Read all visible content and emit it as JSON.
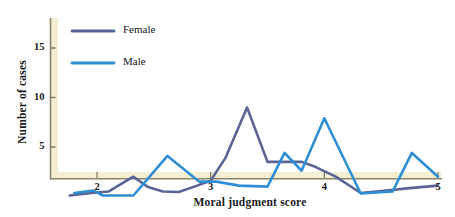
{
  "figure": {
    "background_color": "#ffffff",
    "shadow_color": "#f2ecd2",
    "axis_color": "#7c7660"
  },
  "chart_data": {
    "type": "line",
    "title": "",
    "subtitle": "",
    "xlabel": "Moral judgment score",
    "ylabel": "Number of cases",
    "xlim": [
      1.62,
      5.02
    ],
    "ylim": [
      0,
      18.5
    ],
    "xticks": [
      2,
      3,
      4,
      5
    ],
    "xtick_labels": [
      "2",
      "3",
      "4",
      "5"
    ],
    "yticks": [
      5,
      10,
      15
    ],
    "ytick_labels": [
      "5",
      "10",
      "15"
    ],
    "grid": false,
    "legend_position": "upper-left-inside",
    "series": [
      {
        "name": "Female",
        "color": "#5a6496",
        "points": [
          [
            1.76,
            0.1
          ],
          [
            1.95,
            0.35
          ],
          [
            2.1,
            0.5
          ],
          [
            2.32,
            2.0
          ],
          [
            2.45,
            0.95
          ],
          [
            2.58,
            0.5
          ],
          [
            2.72,
            0.45
          ],
          [
            2.88,
            1.1
          ],
          [
            3.0,
            1.6
          ],
          [
            3.13,
            3.9
          ],
          [
            3.32,
            9.0
          ],
          [
            3.5,
            3.5
          ],
          [
            3.65,
            3.5
          ],
          [
            3.8,
            3.5
          ],
          [
            3.92,
            3.0
          ],
          [
            4.1,
            2.0
          ],
          [
            4.32,
            0.35
          ],
          [
            4.55,
            0.6
          ],
          [
            4.75,
            0.85
          ],
          [
            5.0,
            1.1
          ]
        ]
      },
      {
        "name": "Male",
        "color": "#2f8fd4",
        "points": [
          [
            1.8,
            0.35
          ],
          [
            1.97,
            0.6
          ],
          [
            2.05,
            0.1
          ],
          [
            2.32,
            0.1
          ],
          [
            2.62,
            4.1
          ],
          [
            2.9,
            1.5
          ],
          [
            3.05,
            1.5
          ],
          [
            3.25,
            1.1
          ],
          [
            3.5,
            1.0
          ],
          [
            3.65,
            4.4
          ],
          [
            3.8,
            2.6
          ],
          [
            4.0,
            7.9
          ],
          [
            4.32,
            0.3
          ],
          [
            4.6,
            0.5
          ],
          [
            4.77,
            4.4
          ],
          [
            5.0,
            2.0
          ]
        ]
      }
    ],
    "legend": [
      {
        "label": "Female",
        "color": "#5a6496"
      },
      {
        "label": "Male",
        "color": "#2f8fd4"
      }
    ]
  }
}
